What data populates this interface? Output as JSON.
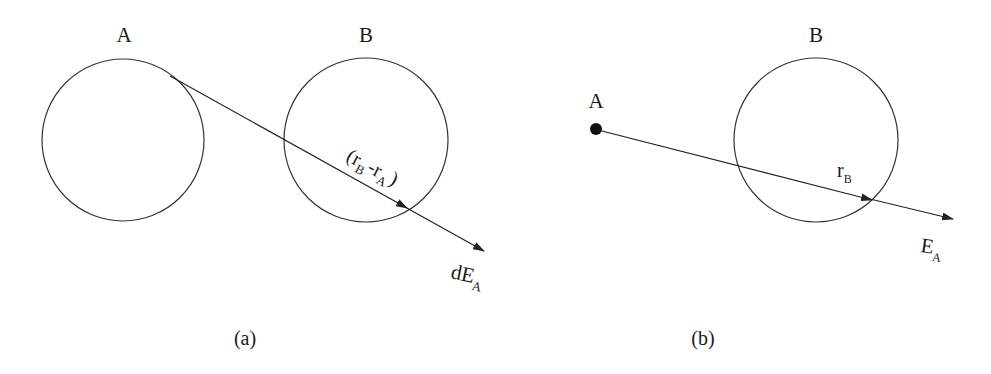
{
  "panel_a": {
    "label_a": "A",
    "label_b": "B",
    "vector_label": {
      "open": "(",
      "r": "r",
      "sub_b": "B",
      "minus": "-",
      "sub_a": "A",
      "close": ")"
    },
    "field_label": {
      "main": "dE",
      "sub": "A"
    },
    "caption": "(a)"
  },
  "panel_b": {
    "label_a": "A",
    "label_b": "B",
    "vector_label": {
      "main": "r",
      "sub": "B"
    },
    "field_label": {
      "main": "E",
      "sub": "A"
    },
    "caption": "(b)"
  },
  "colors": {
    "stroke": "#222222",
    "text": "#1a1a1a",
    "background": "#ffffff"
  }
}
